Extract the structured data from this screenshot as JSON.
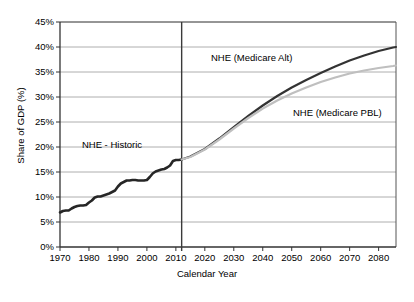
{
  "chart_data": {
    "type": "line",
    "title": "",
    "xlabel": "Calendar Year",
    "ylabel": "Share of GDP (%)",
    "xlim": [
      1970,
      2086
    ],
    "ylim": [
      0,
      45
    ],
    "grid": true,
    "legend_position": "inline-annotations",
    "y_ticks": [
      "0%",
      "5%",
      "10%",
      "15%",
      "20%",
      "25%",
      "30%",
      "35%",
      "40%",
      "45%"
    ],
    "y_tick_values": [
      0,
      5,
      10,
      15,
      20,
      25,
      30,
      35,
      40,
      45
    ],
    "x_ticks": [
      "1970",
      "1980",
      "1990",
      "2000",
      "2010",
      "2020",
      "2030",
      "2040",
      "2050",
      "2060",
      "2070",
      "2080"
    ],
    "x_tick_values": [
      1970,
      1980,
      1990,
      2000,
      2010,
      2020,
      2030,
      2040,
      2050,
      2060,
      2070,
      2080
    ],
    "divider_year": 2012,
    "annotations": [
      {
        "text": "NHE - Historic",
        "x": 1990,
        "y": 20.5
      },
      {
        "text": "NHE (Medicare Alt)",
        "x": 2028,
        "y": 38.5
      },
      {
        "text": "NHE (Medicare PBL)",
        "x": 2060,
        "y": 27.5
      }
    ],
    "series": [
      {
        "name": "NHE - Historic",
        "color": "#262626",
        "width": 2.6,
        "x": [
          1970,
          1971,
          1972,
          1973,
          1974,
          1975,
          1976,
          1977,
          1978,
          1979,
          1980,
          1981,
          1982,
          1983,
          1984,
          1985,
          1986,
          1987,
          1988,
          1989,
          1990,
          1991,
          1992,
          1993,
          1994,
          1995,
          1996,
          1997,
          1998,
          1999,
          2000,
          2001,
          2002,
          2003,
          2004,
          2005,
          2006,
          2007,
          2008,
          2009,
          2010,
          2011,
          2012
        ],
        "values": [
          6.9,
          7.2,
          7.3,
          7.3,
          7.7,
          8.0,
          8.2,
          8.3,
          8.3,
          8.4,
          8.9,
          9.3,
          9.9,
          10.1,
          10.1,
          10.3,
          10.5,
          10.7,
          11.0,
          11.3,
          12.1,
          12.7,
          13.0,
          13.3,
          13.3,
          13.4,
          13.4,
          13.3,
          13.3,
          13.3,
          13.4,
          14.0,
          14.7,
          15.1,
          15.3,
          15.5,
          15.6,
          15.9,
          16.3,
          17.2,
          17.4,
          17.4,
          17.5
        ]
      },
      {
        "name": "NHE (Medicare Alt)",
        "color": "#333333",
        "width": 2.2,
        "x": [
          2012,
          2015,
          2020,
          2025,
          2030,
          2035,
          2040,
          2045,
          2050,
          2055,
          2060,
          2065,
          2070,
          2075,
          2080,
          2085,
          2086
        ],
        "values": [
          17.5,
          18.1,
          19.6,
          21.7,
          24.0,
          26.2,
          28.3,
          30.2,
          31.9,
          33.4,
          34.8,
          36.1,
          37.3,
          38.3,
          39.2,
          39.9,
          40.0
        ]
      },
      {
        "name": "NHE (Medicare PBL)",
        "color": "#bfbfbf",
        "width": 2.2,
        "x": [
          2012,
          2015,
          2020,
          2025,
          2030,
          2035,
          2040,
          2045,
          2050,
          2055,
          2060,
          2065,
          2070,
          2075,
          2080,
          2085,
          2086
        ],
        "values": [
          17.5,
          18.0,
          19.5,
          21.5,
          23.7,
          25.8,
          27.7,
          29.3,
          30.7,
          31.9,
          33.0,
          33.9,
          34.7,
          35.3,
          35.8,
          36.2,
          36.3
        ]
      }
    ]
  }
}
